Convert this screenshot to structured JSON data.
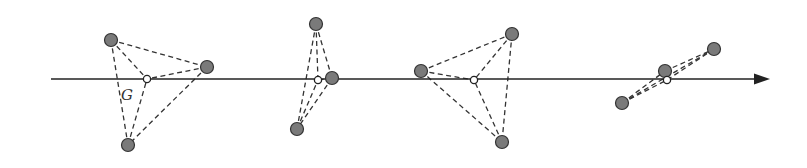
{
  "diagram": {
    "colors": {
      "background": "#ffffff",
      "axis": "#222222",
      "dashed_line": "#333333",
      "particle_fill": "#7a7a7a",
      "particle_stroke": "#333333",
      "centroid_fill": "#ffffff",
      "centroid_stroke": "#222222"
    },
    "axis": {
      "x1": 51,
      "x2": 770,
      "y": 79,
      "arrow": true
    },
    "centroid_label": {
      "text": "G",
      "x": 121,
      "y": 100
    },
    "groups": [
      {
        "id": 1,
        "particles": [
          [
            111,
            40
          ],
          [
            207,
            67
          ],
          [
            128,
            145
          ]
        ],
        "centroid": [
          147,
          79
        ]
      },
      {
        "id": 2,
        "particles": [
          [
            316,
            24
          ],
          [
            332,
            78
          ],
          [
            297,
            129
          ]
        ],
        "centroid": [
          318,
          80
        ]
      },
      {
        "id": 3,
        "particles": [
          [
            421,
            71
          ],
          [
            512,
            34
          ],
          [
            502,
            142
          ]
        ],
        "centroid": [
          474,
          80
        ]
      },
      {
        "id": 4,
        "particles": [
          [
            622,
            103
          ],
          [
            665,
            71
          ],
          [
            714,
            49
          ]
        ],
        "centroid": [
          667,
          80
        ]
      }
    ]
  }
}
